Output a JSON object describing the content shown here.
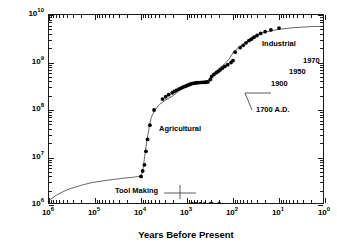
{
  "chart_data": {
    "type": "line",
    "title": "",
    "xlabel": "Years Before Present",
    "ylabel": "World Population",
    "xscale": "log",
    "yscale": "log",
    "x_reversed": true,
    "xlim": [
      1000000,
      1
    ],
    "ylim": [
      1000000,
      10000000000
    ],
    "grid": false,
    "legend": null,
    "xticks": [
      {
        "value": 1000000,
        "mantissa": "10",
        "exponent": "6"
      },
      {
        "value": 100000,
        "mantissa": "10",
        "exponent": "5"
      },
      {
        "value": 10000,
        "mantissa": "10",
        "exponent": "4"
      },
      {
        "value": 1000,
        "mantissa": "10",
        "exponent": "3"
      },
      {
        "value": 100,
        "mantissa": "10",
        "exponent": "2"
      },
      {
        "value": 10,
        "mantissa": "10",
        "exponent": "1"
      },
      {
        "value": 1,
        "mantissa": "10",
        "exponent": "0"
      }
    ],
    "yticks": [
      {
        "value": 10000000000,
        "mantissa": "10",
        "exponent": "10"
      },
      {
        "value": 1000000000,
        "mantissa": "10",
        "exponent": "9"
      },
      {
        "value": 100000000,
        "mantissa": "10",
        "exponent": "8"
      },
      {
        "value": 10000000,
        "mantissa": "10",
        "exponent": "7"
      },
      {
        "value": 1000000,
        "mantissa": "10",
        "exponent": "6"
      }
    ],
    "series": [
      {
        "name": "World population trend curve",
        "style": "line",
        "color": "#555555",
        "points": [
          [
            1000000,
            1250000
          ],
          [
            700000,
            1600000
          ],
          [
            500000,
            1900000
          ],
          [
            350000,
            2200000
          ],
          [
            200000,
            2600000
          ],
          [
            120000,
            2950000
          ],
          [
            70000,
            3200000
          ],
          [
            40000,
            3450000
          ],
          [
            25000,
            3650000
          ],
          [
            16000,
            3800000
          ],
          [
            12000,
            3950000
          ],
          [
            10500,
            4050000
          ],
          [
            9500,
            4500000
          ],
          [
            9000,
            6000000
          ],
          [
            8500,
            9000000
          ],
          [
            8000,
            14000000
          ],
          [
            7500,
            22000000
          ],
          [
            7000,
            32000000
          ],
          [
            6500,
            48000000
          ],
          [
            6000,
            70000000
          ],
          [
            5000,
            100000000
          ],
          [
            4000,
            130000000
          ],
          [
            3000,
            160000000
          ],
          [
            2000,
            200000000
          ],
          [
            1500,
            250000000
          ],
          [
            1200,
            300000000
          ],
          [
            1000,
            330000000
          ],
          [
            800,
            360000000
          ],
          [
            600,
            380000000
          ],
          [
            450,
            400000000
          ],
          [
            350,
            420000000
          ],
          [
            300,
            500000000
          ],
          [
            250,
            600000000
          ],
          [
            200,
            750000000
          ],
          [
            150,
            950000000
          ],
          [
            120,
            1200000000
          ],
          [
            100,
            1600000000
          ],
          [
            80,
            2000000000
          ],
          [
            60,
            2400000000
          ],
          [
            50,
            2800000000
          ],
          [
            40,
            3300000000
          ],
          [
            30,
            3800000000
          ],
          [
            20,
            4400000000
          ],
          [
            10,
            5000000000
          ],
          [
            5,
            5400000000
          ],
          [
            2,
            5700000000
          ],
          [
            1,
            5800000000
          ]
        ]
      },
      {
        "name": "Population estimates",
        "style": "scatter",
        "marker": "filled-circle",
        "color": "#000000",
        "points": [
          [
            10000,
            4000000
          ],
          [
            9200,
            5200000
          ],
          [
            8400,
            7000000
          ],
          [
            7800,
            13500000
          ],
          [
            7200,
            24000000
          ],
          [
            6400,
            48000000
          ],
          [
            5200,
            100000000
          ],
          [
            3400,
            170000000
          ],
          [
            2900,
            190000000
          ],
          [
            2500,
            210000000
          ],
          [
            2100,
            230000000
          ],
          [
            1900,
            245000000
          ],
          [
            1700,
            260000000
          ],
          [
            1500,
            275000000
          ],
          [
            1350,
            290000000
          ],
          [
            1250,
            300000000
          ],
          [
            1150,
            310000000
          ],
          [
            1050,
            320000000
          ],
          [
            980,
            330000000
          ],
          [
            900,
            340000000
          ],
          [
            840,
            350000000
          ],
          [
            780,
            360000000
          ],
          [
            720,
            365000000
          ],
          [
            660,
            370000000
          ],
          [
            600,
            375000000
          ],
          [
            540,
            378000000
          ],
          [
            480,
            380000000
          ],
          [
            430,
            382000000
          ],
          [
            390,
            384000000
          ],
          [
            350,
            390000000
          ],
          [
            310,
            440000000
          ],
          [
            290,
            510000000
          ],
          [
            260,
            560000000
          ],
          [
            230,
            610000000
          ],
          [
            210,
            650000000
          ],
          [
            190,
            700000000
          ],
          [
            170,
            760000000
          ],
          [
            150,
            830000000
          ],
          [
            130,
            900000000
          ],
          [
            110,
            1000000000
          ],
          [
            100,
            1100000000
          ],
          [
            90,
            1650000000
          ],
          [
            70,
            2050000000
          ],
          [
            60,
            2300000000
          ],
          [
            52,
            2600000000
          ],
          [
            45,
            2900000000
          ],
          [
            40,
            3100000000
          ],
          [
            35,
            3400000000
          ],
          [
            30,
            3700000000
          ],
          [
            25,
            4100000000
          ],
          [
            20,
            4450000000
          ],
          [
            15,
            4850000000
          ],
          [
            10,
            5300000000
          ],
          [
            1,
            5600000000
          ]
        ]
      }
    ],
    "annotations": [
      {
        "id": "tool-making",
        "text": "Tool Making",
        "x": 60000,
        "y": 5300000,
        "px": 66,
        "py": 172
      },
      {
        "id": "five-thousand-bc",
        "text": "5000 B.C.",
        "x": 6000,
        "y": 2400000,
        "px": 141,
        "py": 186
      },
      {
        "id": "agricultural",
        "text": "Agricultural",
        "x": 3500,
        "y": 130000000,
        "px": 110,
        "py": 110
      },
      {
        "id": "seventeen-hundred-ad",
        "text": "1700 A.D.",
        "x": 230,
        "y": 130000000,
        "px": 207,
        "py": 91
      },
      {
        "id": "nineteen-hundred",
        "text": "1900",
        "x": 80,
        "y": 1000000000,
        "px": 222,
        "py": 65
      },
      {
        "id": "nineteen-fifty",
        "text": "1950",
        "x": 38,
        "y": 2100000000,
        "px": 240,
        "py": 53
      },
      {
        "id": "nineteen-seventy",
        "text": "1970",
        "x": 22,
        "y": 3200000000,
        "px": 254,
        "py": 42
      },
      {
        "id": "industrial",
        "text": "Industrial",
        "x": 70,
        "y": 5500000000,
        "px": 213,
        "py": 25
      },
      {
        "id": "nineteen-ninety",
        "text": "1990",
        "x": 1.6,
        "y": 4300000000,
        "px": 295,
        "py": 33
      }
    ],
    "leader_lines": [
      {
        "id": "tool-making-leader",
        "x1": 115,
        "y1": 178,
        "x2": 147,
        "y2": 178
      },
      {
        "id": "five-thousand-bc-leader",
        "x1": 131,
        "y1": 170,
        "x2": 131,
        "y2": 184
      },
      {
        "id": "seventeen-hundred-ad-leader",
        "x1": 196,
        "y1": 78,
        "x2": 203,
        "y2": 95
      },
      {
        "id": "seventeen-hundred-ad-leader-2",
        "x1": 196,
        "y1": 78,
        "x2": 222,
        "y2": 78
      }
    ]
  },
  "axes": {
    "y_title": "World Population",
    "x_title": "Years Before Present"
  }
}
